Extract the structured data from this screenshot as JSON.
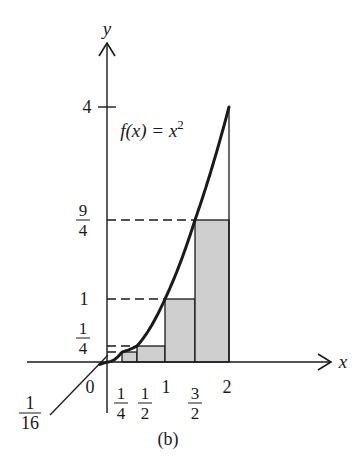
{
  "figure": {
    "caption": "(b)",
    "function_label": {
      "prefix": "f(x) = x",
      "exponent": "2"
    },
    "axes": {
      "x_label": "x",
      "y_label": "y"
    },
    "x_ticks": [
      {
        "value": 0,
        "label": "0",
        "type": "plain"
      },
      {
        "value": 0.25,
        "num": "1",
        "den": "4",
        "type": "fraction"
      },
      {
        "value": 0.5,
        "num": "1",
        "den": "2",
        "type": "fraction"
      },
      {
        "value": 1,
        "label": "1",
        "type": "plain"
      },
      {
        "value": 1.5,
        "num": "3",
        "den": "2",
        "type": "fraction"
      },
      {
        "value": 2,
        "label": "2",
        "type": "plain"
      }
    ],
    "y_ticks": [
      {
        "value": 4,
        "label": "4",
        "type": "plain"
      },
      {
        "value": 2.25,
        "num": "9",
        "den": "4",
        "type": "fraction"
      },
      {
        "value": 1,
        "label": "1",
        "type": "plain"
      },
      {
        "value": 0.25,
        "num": "1",
        "den": "4",
        "type": "fraction"
      }
    ],
    "callout": {
      "num": "1",
      "den": "16",
      "value": 0.0625
    },
    "colors": {
      "ink": "#1a1a1a",
      "rect_fill": "#cfcfcf",
      "background": "#ffffff"
    }
  },
  "chart_data": {
    "type": "area",
    "subtitle": "(b)",
    "xlabel": "x",
    "ylabel": "y",
    "function": "x^2",
    "curve": {
      "x": [
        0,
        0.25,
        0.5,
        1,
        1.5,
        2
      ],
      "y": [
        0,
        0.0625,
        0.25,
        1,
        2.25,
        4
      ]
    },
    "rectangles": [
      {
        "x_start": 0.25,
        "x_end": 0.5,
        "height": 0.0625
      },
      {
        "x_start": 0.5,
        "x_end": 1,
        "height": 0.25
      },
      {
        "x_start": 1,
        "x_end": 1.5,
        "height": 1
      },
      {
        "x_start": 1.5,
        "x_end": 2,
        "height": 2.25
      }
    ],
    "dashed_reference_lines_y": [
      0.0625,
      0.25,
      1,
      2.25
    ],
    "x_tick_labels": [
      "0",
      "1/4",
      "1/2",
      "1",
      "3/2",
      "2"
    ],
    "y_tick_labels": [
      "1/16",
      "1/4",
      "1",
      "9/4",
      "4"
    ],
    "xlim": [
      0,
      2
    ],
    "ylim": [
      0,
      4
    ],
    "grid": false,
    "legend": "none"
  }
}
